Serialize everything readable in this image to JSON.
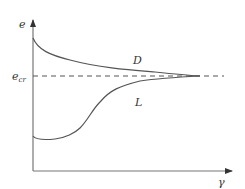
{
  "diagram": {
    "colors": {
      "line": "#555555",
      "dash": "#555555",
      "text": "#333333",
      "background": "#ffffff"
    },
    "axes": {
      "y_label": "e",
      "x_label": "γ",
      "ref_label_main": "e",
      "ref_label_sub": "cr"
    },
    "curves": [
      {
        "name": "D",
        "label": "D",
        "description": "decreasing curve from high e converging to e_cr"
      },
      {
        "name": "L",
        "label": "L",
        "description": "increasing curve from low e converging to e_cr"
      }
    ],
    "reference_line": {
      "label": "e_cr",
      "style": "dashed"
    }
  }
}
